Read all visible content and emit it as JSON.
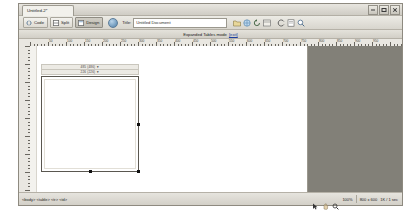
{
  "window": {
    "document_tab": "Untitled-2*",
    "minimize_label": "Minimize",
    "maximize_label": "Maximize",
    "close_label": "Close"
  },
  "toolbar": {
    "code_label": "Code",
    "split_label": "Split",
    "design_label": "Design",
    "preview_icon": "globe-icon",
    "title_label": "Title:",
    "title_value": "Untitled Document",
    "title_placeholder": "Untitled Document",
    "icons": [
      "file-management-icon",
      "preview-in-browser-icon",
      "refresh-design-view-icon",
      "view-options-icon",
      "visual-aids-icon",
      "validate-markup-icon",
      "check-browser-support-icon"
    ]
  },
  "banner": {
    "text": "Expanded Tables mode",
    "exit_label": "[exit]"
  },
  "rulers": {
    "horizontal_unit": "pixels",
    "horizontal_ticks": [
      "50",
      "100",
      "150",
      "200",
      "250",
      "300",
      "350",
      "400",
      "450",
      "500",
      "550",
      "600",
      "650",
      "700",
      "750",
      "800",
      "850",
      "900",
      "950"
    ],
    "vertical_unit": "pixels"
  },
  "table": {
    "width_label_top": "485 (486) ▼",
    "width_label_bottom": "226 (226) ▼",
    "selected": true,
    "handles": [
      "right-handle",
      "bottom-handle",
      "corner-handle"
    ]
  },
  "status": {
    "tag_selector": [
      "<body>",
      "<table>",
      "<tr>",
      "<td>"
    ],
    "tag_selector_text": "<body> <table> <tr> <td>",
    "zoom": "100%",
    "window_size": "800 x 600",
    "download_size": "1K / 1 sec",
    "select_tool_icon": "arrow-select-icon",
    "hand_tool_icon": "hand-icon",
    "zoom_tool_icon": "magnifier-icon"
  }
}
